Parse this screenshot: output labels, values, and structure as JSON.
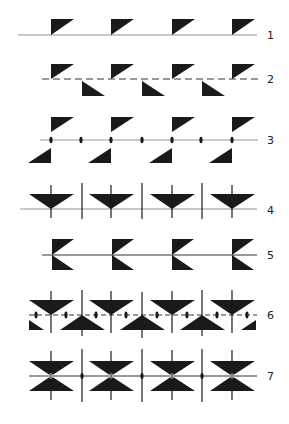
{
  "figure": {
    "ink_color": "#1a1a1a",
    "line_color": "#555555",
    "rows": [
      {
        "label": "1",
        "y": 35,
        "kind": "translation"
      },
      {
        "label": "2",
        "y": 79,
        "kind": "glide-reflection"
      },
      {
        "label": "3",
        "y": 140,
        "kind": "half-turn"
      },
      {
        "label": "4",
        "y": 209,
        "kind": "vertical-mirror"
      },
      {
        "label": "5",
        "y": 255,
        "kind": "horizontal-mirror"
      },
      {
        "label": "6",
        "y": 315,
        "kind": "vertical-mirror-glide"
      },
      {
        "label": "7",
        "y": 376,
        "kind": "full-symmetry"
      }
    ],
    "unit_centers_x": [
      51,
      111,
      172,
      232
    ]
  }
}
